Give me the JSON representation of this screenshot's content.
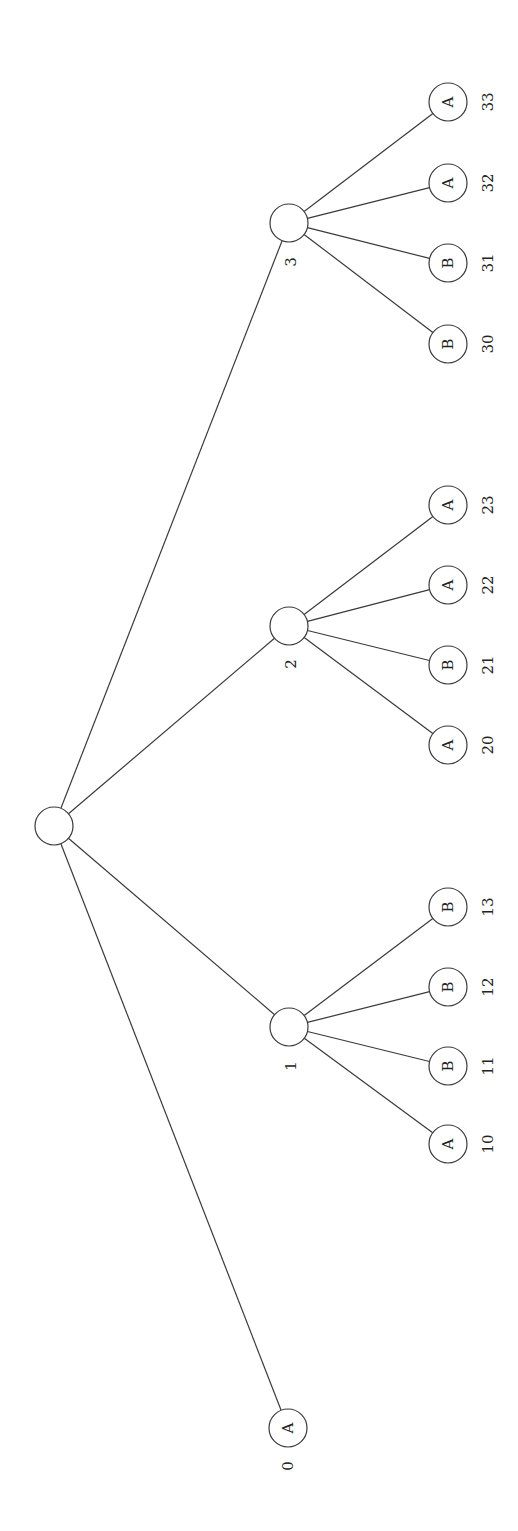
{
  "diagram": {
    "type": "tree",
    "orientation": "rotated-90",
    "colors": {
      "stroke": "#3a3a3a",
      "text": "#222222",
      "background": "#ffffff"
    },
    "root": {
      "id": "root",
      "x": 54,
      "y": 826,
      "label": ""
    },
    "nodes": [
      {
        "id": "n0",
        "x": 288,
        "y": 1428,
        "letter": "A",
        "index": "0",
        "lx": 288,
        "ly": 1466
      },
      {
        "id": "n1",
        "x": 289,
        "y": 1027,
        "letter": "",
        "index": "1",
        "lx": 291,
        "ly": 1066
      },
      {
        "id": "n2",
        "x": 289,
        "y": 626,
        "letter": "",
        "index": "2",
        "lx": 291,
        "ly": 664
      },
      {
        "id": "n3",
        "x": 289,
        "y": 223,
        "letter": "",
        "index": "3",
        "lx": 291,
        "ly": 262
      },
      {
        "id": "n10",
        "x": 448,
        "y": 1144,
        "letter": "A",
        "index": "10",
        "lx": 488,
        "ly": 1144
      },
      {
        "id": "n11",
        "x": 448,
        "y": 1066,
        "letter": "B",
        "index": "11",
        "lx": 488,
        "ly": 1066
      },
      {
        "id": "n12",
        "x": 448,
        "y": 987,
        "letter": "B",
        "index": "12",
        "lx": 488,
        "ly": 987
      },
      {
        "id": "n13",
        "x": 448,
        "y": 907,
        "letter": "B",
        "index": "13",
        "lx": 488,
        "ly": 907
      },
      {
        "id": "n20",
        "x": 448,
        "y": 745,
        "letter": "A",
        "index": "20",
        "lx": 488,
        "ly": 745
      },
      {
        "id": "n21",
        "x": 448,
        "y": 665,
        "letter": "B",
        "index": "21",
        "lx": 488,
        "ly": 665
      },
      {
        "id": "n22",
        "x": 448,
        "y": 585,
        "letter": "A",
        "index": "22",
        "lx": 488,
        "ly": 585
      },
      {
        "id": "n23",
        "x": 448,
        "y": 505,
        "letter": "A",
        "index": "23",
        "lx": 488,
        "ly": 505
      },
      {
        "id": "n30",
        "x": 448,
        "y": 344,
        "letter": "B",
        "index": "30",
        "lx": 488,
        "ly": 344
      },
      {
        "id": "n31",
        "x": 448,
        "y": 263,
        "letter": "B",
        "index": "31",
        "lx": 488,
        "ly": 263
      },
      {
        "id": "n32",
        "x": 448,
        "y": 183,
        "letter": "A",
        "index": "32",
        "lx": 488,
        "ly": 183
      },
      {
        "id": "n33",
        "x": 448,
        "y": 102,
        "letter": "A",
        "index": "33",
        "lx": 488,
        "ly": 102
      }
    ],
    "edges": [
      [
        "root",
        "n0"
      ],
      [
        "root",
        "n1"
      ],
      [
        "root",
        "n2"
      ],
      [
        "root",
        "n3"
      ],
      [
        "n1",
        "n10"
      ],
      [
        "n1",
        "n11"
      ],
      [
        "n1",
        "n12"
      ],
      [
        "n1",
        "n13"
      ],
      [
        "n2",
        "n20"
      ],
      [
        "n2",
        "n21"
      ],
      [
        "n2",
        "n22"
      ],
      [
        "n2",
        "n23"
      ],
      [
        "n3",
        "n30"
      ],
      [
        "n3",
        "n31"
      ],
      [
        "n3",
        "n32"
      ],
      [
        "n3",
        "n33"
      ]
    ],
    "radius": 19
  }
}
